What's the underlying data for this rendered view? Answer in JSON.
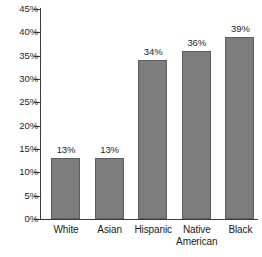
{
  "chart_data": {
    "type": "bar",
    "title": "",
    "subtitle": "",
    "xlabel": "",
    "ylabel": "",
    "categories": [
      "White",
      "Asian",
      "Hispanic",
      "Native\nAmerican",
      "Black"
    ],
    "values": [
      13,
      34,
      36,
      39,
      13
    ],
    "series": [
      {
        "name": "",
        "values": [
          13,
          13,
          34,
          36,
          39
        ]
      }
    ],
    "bars": [
      {
        "category": "White",
        "value": 13,
        "label": "13%"
      },
      {
        "category": "Asian",
        "value": 13,
        "label": "13%"
      },
      {
        "category": "Hispanic",
        "value": 34,
        "label": "34%"
      },
      {
        "category": "Native American",
        "value": 36,
        "label": "36%"
      },
      {
        "category": "Black",
        "value": 39,
        "label": "39%"
      }
    ],
    "ylim": [
      0,
      45
    ],
    "ytick_values": [
      0,
      5,
      10,
      15,
      20,
      25,
      30,
      35,
      40,
      45
    ],
    "ytick_labels": [
      "0%",
      "5%",
      "10%",
      "15%",
      "20%",
      "25%",
      "30%",
      "35%",
      "40%",
      "45%"
    ],
    "grid": false,
    "legend": null,
    "legend_position": "none",
    "value_labels_shown": true,
    "colors": {
      "bar_fill": "#7d7d7d",
      "bar_border": "#5e5e5e",
      "axis": "#3c3c3c",
      "text": "#1a1a1a",
      "background": "#ffffff"
    }
  },
  "axis": {
    "y_ticks": [
      {
        "label": "45%",
        "value": 45
      },
      {
        "label": "40%",
        "value": 40
      },
      {
        "label": "35%",
        "value": 35
      },
      {
        "label": "30%",
        "value": 30
      },
      {
        "label": "25%",
        "value": 25
      },
      {
        "label": "20%",
        "value": 20
      },
      {
        "label": "15%",
        "value": 15
      },
      {
        "label": "10%",
        "value": 10
      },
      {
        "label": "5%",
        "value": 5
      },
      {
        "label": "0%",
        "value": 0
      }
    ]
  },
  "categories": [
    {
      "line1": "White",
      "line2": ""
    },
    {
      "line1": "Asian",
      "line2": ""
    },
    {
      "line1": "Hispanic",
      "line2": ""
    },
    {
      "line1": "Native",
      "line2": "American"
    },
    {
      "line1": "Black",
      "line2": ""
    }
  ]
}
